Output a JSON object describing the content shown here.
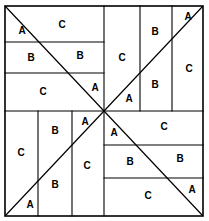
{
  "figure": {
    "type": "geometric-pattern",
    "shape": "square",
    "symmetry": "4-fold rotational",
    "stroke_color": "#000000",
    "fill_color": "#ffffff",
    "frame": {
      "x": 5,
      "y": 6,
      "width": 198,
      "height": 210
    },
    "center": {
      "x": 104,
      "y": 111
    },
    "piece_letters": [
      "A",
      "B",
      "C"
    ]
  },
  "geometry": {
    "diagonals": [
      {
        "name": "diagonal-tl-br",
        "x1": 5,
        "y1": 6,
        "x2": 203,
        "y2": 216
      },
      {
        "name": "diagonal-bl-tr",
        "x1": 5,
        "y1": 216,
        "x2": 203,
        "y2": 6
      }
    ],
    "quadrant_top_left": {
      "orientation": "horizontal-bands",
      "dividers_y": [
        42,
        73
      ]
    },
    "quadrant_top_right": {
      "orientation": "vertical-bands",
      "dividers_x": [
        140,
        172
      ]
    },
    "quadrant_bottom_left": {
      "orientation": "vertical-bands",
      "dividers_x": [
        38,
        72
      ]
    },
    "quadrant_bottom_right": {
      "orientation": "horizontal-bands",
      "dividers_y": [
        145,
        178
      ]
    },
    "midlines": [
      {
        "name": "vertical-midline-top",
        "x1": 104,
        "y1": 6,
        "x2": 104,
        "y2": 111
      },
      {
        "name": "vertical-midline-bottom",
        "x1": 104,
        "y1": 111,
        "x2": 104,
        "y2": 216
      },
      {
        "name": "horizontal-midline-left",
        "x1": 5,
        "y1": 111,
        "x2": 104,
        "y2": 111
      },
      {
        "name": "horizontal-midline-right",
        "x1": 104,
        "y1": 111,
        "x2": 203,
        "y2": 111
      }
    ]
  },
  "labels": [
    {
      "id": "tl-band1-a",
      "text": "A",
      "x": 22,
      "y": 31,
      "quadrant": "top-left",
      "region": "band-1-left-of-diagonal"
    },
    {
      "id": "tl-band1-c",
      "text": "C",
      "x": 62,
      "y": 25,
      "quadrant": "top-left",
      "region": "band-1-right-of-diagonal"
    },
    {
      "id": "tl-band2-b1",
      "text": "B",
      "x": 31,
      "y": 58,
      "quadrant": "top-left",
      "region": "band-2-left-of-diagonal"
    },
    {
      "id": "tl-band2-b2",
      "text": "B",
      "x": 80,
      "y": 56,
      "quadrant": "top-left",
      "region": "band-2-right-of-diagonal"
    },
    {
      "id": "tl-band3-c",
      "text": "C",
      "x": 43,
      "y": 92,
      "quadrant": "top-left",
      "region": "band-3-left-of-diagonal"
    },
    {
      "id": "tl-band3-a",
      "text": "A",
      "x": 95,
      "y": 88,
      "quadrant": "top-left",
      "region": "band-3-right-of-diagonal"
    },
    {
      "id": "tr-col1-c",
      "text": "C",
      "x": 122,
      "y": 58,
      "quadrant": "top-right",
      "region": "column-1-above-diagonal"
    },
    {
      "id": "tr-col1-a",
      "text": "A",
      "x": 129,
      "y": 99,
      "quadrant": "top-right",
      "region": "column-1-below-diagonal"
    },
    {
      "id": "tr-col2-b1",
      "text": "B",
      "x": 155,
      "y": 32,
      "quadrant": "top-right",
      "region": "column-2-above-diagonal"
    },
    {
      "id": "tr-col2-b2",
      "text": "B",
      "x": 155,
      "y": 85,
      "quadrant": "top-right",
      "region": "column-2-below-diagonal"
    },
    {
      "id": "tr-col3-a",
      "text": "A",
      "x": 188,
      "y": 17,
      "quadrant": "top-right",
      "region": "column-3-above-diagonal"
    },
    {
      "id": "tr-col3-c",
      "text": "C",
      "x": 189,
      "y": 69,
      "quadrant": "top-right",
      "region": "column-3-below-diagonal"
    },
    {
      "id": "bl-col1-c",
      "text": "C",
      "x": 21,
      "y": 153,
      "quadrant": "bottom-left",
      "region": "column-1-above-diagonal"
    },
    {
      "id": "bl-col1-a",
      "text": "A",
      "x": 30,
      "y": 205,
      "quadrant": "bottom-left",
      "region": "column-1-below-diagonal"
    },
    {
      "id": "bl-col2-b1",
      "text": "B",
      "x": 55,
      "y": 131,
      "quadrant": "bottom-left",
      "region": "column-2-above-diagonal"
    },
    {
      "id": "bl-col2-b2",
      "text": "B",
      "x": 55,
      "y": 185,
      "quadrant": "bottom-left",
      "region": "column-2-below-diagonal"
    },
    {
      "id": "bl-col3-a",
      "text": "A",
      "x": 85,
      "y": 122,
      "quadrant": "bottom-left",
      "region": "column-3-above-diagonal"
    },
    {
      "id": "bl-col3-c",
      "text": "C",
      "x": 87,
      "y": 166,
      "quadrant": "bottom-left",
      "region": "column-3-below-diagonal"
    },
    {
      "id": "br-band1-a",
      "text": "A",
      "x": 114,
      "y": 133,
      "quadrant": "bottom-right",
      "region": "band-1-left-of-diagonal"
    },
    {
      "id": "br-band1-c",
      "text": "C",
      "x": 164,
      "y": 127,
      "quadrant": "bottom-right",
      "region": "band-1-right-of-diagonal"
    },
    {
      "id": "br-band2-b1",
      "text": "B",
      "x": 130,
      "y": 162,
      "quadrant": "bottom-right",
      "region": "band-2-left-of-diagonal"
    },
    {
      "id": "br-band2-b2",
      "text": "B",
      "x": 180,
      "y": 159,
      "quadrant": "bottom-right",
      "region": "band-2-right-of-diagonal"
    },
    {
      "id": "br-band3-c",
      "text": "C",
      "x": 148,
      "y": 196,
      "quadrant": "bottom-right",
      "region": "band-3-left-of-diagonal"
    },
    {
      "id": "br-band3-a",
      "text": "A",
      "x": 192,
      "y": 190,
      "quadrant": "bottom-right",
      "region": "band-3-right-of-diagonal"
    }
  ]
}
